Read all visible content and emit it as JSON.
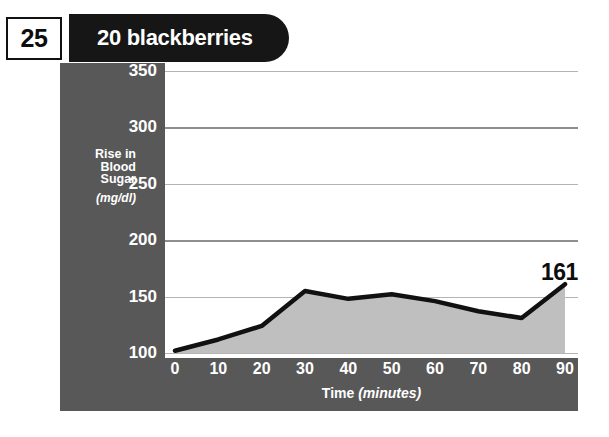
{
  "header": {
    "number_badge": "25",
    "title": "20 blackberries"
  },
  "chart_data": {
    "type": "area",
    "title": "20 blackberries",
    "xlabel": "Time",
    "xlabel_unit": "(minutes)",
    "ylabel": "Rise in\nBlood\nSugar",
    "ylabel_line1": "Rise in",
    "ylabel_line2": "Blood",
    "ylabel_line3": "Sugar",
    "ylabel_unit": "(mg/dl)",
    "x": [
      0,
      10,
      20,
      30,
      40,
      50,
      60,
      70,
      80,
      90
    ],
    "values": [
      102,
      112,
      124,
      155,
      148,
      152,
      146,
      137,
      131,
      161
    ],
    "xticklabels": [
      "0",
      "10",
      "20",
      "30",
      "40",
      "50",
      "60",
      "70",
      "80",
      "90"
    ],
    "yticklabels": [
      "100",
      "150",
      "200",
      "250",
      "300",
      "350"
    ],
    "yticks": [
      100,
      150,
      200,
      250,
      300,
      350
    ],
    "xlim": [
      0,
      90
    ],
    "ylim": [
      100,
      350
    ],
    "grid": true,
    "legend": "none",
    "annotations": [
      {
        "text": "161",
        "x": 90,
        "y": 161
      }
    ],
    "colors": {
      "panel": "#585858",
      "plot_bg": "#ffffff",
      "line": "#111111",
      "fill": "#bfbfbf",
      "gridline": "#b4b4b4",
      "tick_text": "#ffffff",
      "annotation_text": "#0d0d0d",
      "title_pill": "#161616",
      "badge_bg": "#ffffff",
      "badge_border": "#111111"
    }
  }
}
